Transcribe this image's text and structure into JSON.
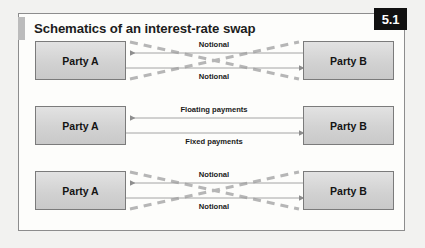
{
  "figure": {
    "title": "Schematics of an interest-rate swap",
    "badge": "5.1",
    "accent_color": "#bcbcbc",
    "badge_bg": "#111111",
    "badge_fg": "#ffffff",
    "frame_border_color": "#8d8d8d",
    "frame_bg": "#fdfdfb",
    "page_bg": "#f2f2f0"
  },
  "style": {
    "box_fill_top": "#e2e2e2",
    "box_fill_bottom": "#c9c9c9",
    "box_border": "#7b7b7b",
    "arrow_color": "#9a9a9a",
    "dashed_color": "#b6b6b6",
    "label_color": "#1a1a1a"
  },
  "rows": [
    {
      "id": "row-notional-initial",
      "left_box": "Party A",
      "right_box": "Party B",
      "has_crossing_dashed": true,
      "edges": [
        {
          "label": "Notional",
          "direction": "left",
          "position": "upper"
        },
        {
          "label": "Notional",
          "direction": "right",
          "position": "lower"
        }
      ]
    },
    {
      "id": "row-payments",
      "left_box": "Party A",
      "right_box": "Party B",
      "has_crossing_dashed": false,
      "edges": [
        {
          "label": "Floating payments",
          "direction": "left",
          "position": "upper"
        },
        {
          "label": "Fixed payments",
          "direction": "right",
          "position": "lower"
        }
      ]
    },
    {
      "id": "row-notional-final",
      "left_box": "Party A",
      "right_box": "Party B",
      "has_crossing_dashed": true,
      "edges": [
        {
          "label": "Notional",
          "direction": "left",
          "position": "upper"
        },
        {
          "label": "Notional",
          "direction": "right",
          "position": "lower"
        }
      ]
    }
  ]
}
